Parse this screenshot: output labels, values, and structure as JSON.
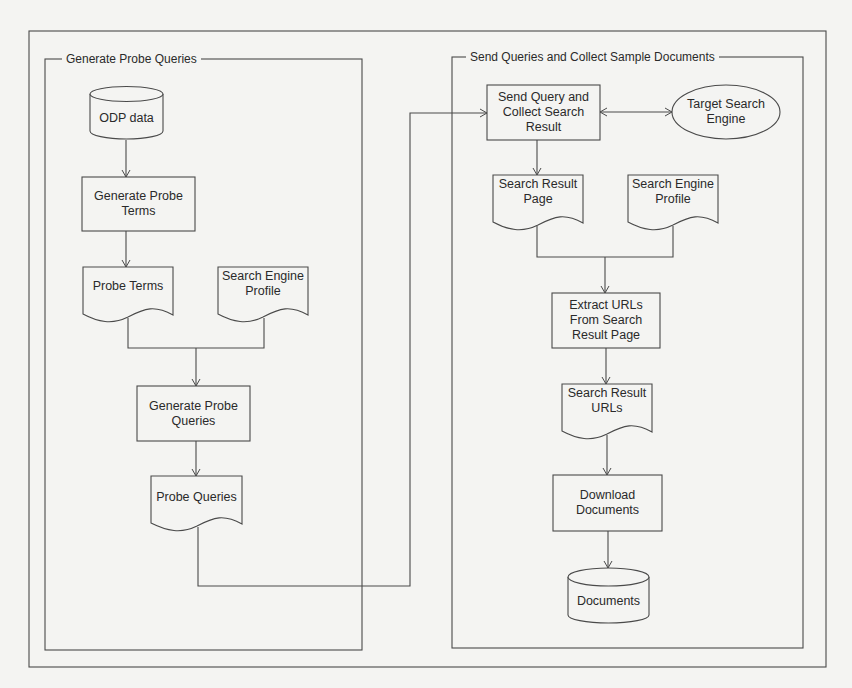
{
  "groups": {
    "left": {
      "title": "Generate Probe Queries"
    },
    "right": {
      "title": "Send Queries and Collect Sample Documents"
    }
  },
  "nodes": {
    "odp_data": {
      "label": "ODP data",
      "shape": "database"
    },
    "generate_probe_terms": {
      "label": "Generate Probe\nTerms",
      "shape": "process"
    },
    "probe_terms": {
      "label": "Probe Terms",
      "shape": "document"
    },
    "search_engine_profile_left": {
      "label": "Search Engine\nProfile",
      "shape": "document"
    },
    "generate_probe_queries": {
      "label": "Generate Probe\nQueries",
      "shape": "process"
    },
    "probe_queries": {
      "label": "Probe Queries",
      "shape": "document"
    },
    "send_query": {
      "label": "Send Query and\nCollect Search\nResult",
      "shape": "process"
    },
    "target_search_engine": {
      "label": "Target Search\nEngine",
      "shape": "ellipse"
    },
    "search_result_page": {
      "label": "Search Result\nPage",
      "shape": "document"
    },
    "search_engine_profile_right": {
      "label": "Search Engine\nProfile",
      "shape": "document"
    },
    "extract_urls": {
      "label": "Extract URLs\nFrom Search\nResult Page",
      "shape": "process"
    },
    "search_result_urls": {
      "label": "Search Result\nURLs",
      "shape": "document"
    },
    "download_documents": {
      "label": "Download\nDocuments",
      "shape": "process"
    },
    "documents": {
      "label": "Documents",
      "shape": "database"
    }
  },
  "edges": [
    {
      "from": "ODP data",
      "to": "Generate Probe Terms"
    },
    {
      "from": "Generate Probe Terms",
      "to": "Probe Terms"
    },
    {
      "from": "Probe Terms",
      "to": "Generate Probe Queries"
    },
    {
      "from": "Search Engine Profile",
      "to": "Generate Probe Queries"
    },
    {
      "from": "Generate Probe Queries",
      "to": "Probe Queries"
    },
    {
      "from": "Probe Queries",
      "to": "Send Query and Collect Search Result"
    },
    {
      "from": "Send Query and Collect Search Result",
      "to": "Target Search Engine",
      "bidirectional": true
    },
    {
      "from": "Send Query and Collect Search Result",
      "to": "Search Result Page"
    },
    {
      "from": "Search Result Page",
      "to": "Extract URLs From Search Result Page"
    },
    {
      "from": "Search Engine Profile",
      "to": "Extract URLs From Search Result Page"
    },
    {
      "from": "Extract URLs From Search Result Page",
      "to": "Search Result URLs"
    },
    {
      "from": "Search Result URLs",
      "to": "Download Documents"
    },
    {
      "from": "Download Documents",
      "to": "Documents"
    }
  ],
  "colors": {
    "background": "#f4f4f2",
    "stroke": "#4a4a4a",
    "text": "#2a2a2a"
  }
}
